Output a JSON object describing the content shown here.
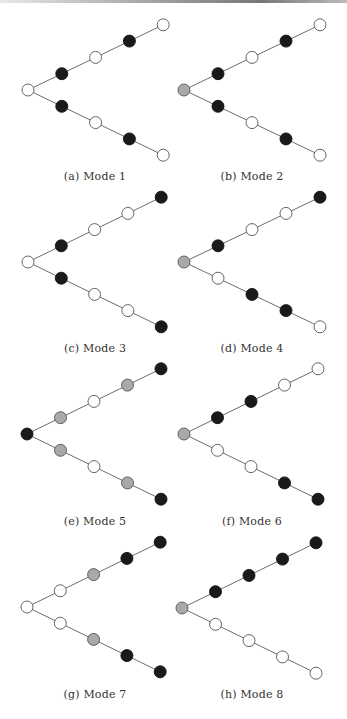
{
  "figure": {
    "colors": {
      "white": "#ffffff",
      "black": "#1a1a1a",
      "gray": "#a9a9a9",
      "edge": "#6e6e6e",
      "stroke": "#555555"
    },
    "node_radius": 6,
    "panels": [
      {
        "id": "a",
        "caption": "(a) Mode 1",
        "root": [
          28,
          90
        ],
        "dx": 33.8,
        "dy": 16.3,
        "caption_pos": [
          95,
          170
        ],
        "root_color": "white",
        "upper": [
          "black",
          "white",
          "black",
          "white"
        ],
        "lower": [
          "black",
          "white",
          "black",
          "white"
        ]
      },
      {
        "id": "b",
        "caption": "(b) Mode 2",
        "root": [
          184,
          90
        ],
        "dx": 34,
        "dy": 16.3,
        "caption_pos": [
          252,
          170
        ],
        "root_color": "gray",
        "upper": [
          "black",
          "white",
          "black",
          "white"
        ],
        "lower": [
          "black",
          "white",
          "black",
          "white"
        ]
      },
      {
        "id": "c",
        "caption": "(c) Mode 3",
        "root": [
          28,
          262
        ],
        "dx": 33.3,
        "dy": 16.2,
        "caption_pos": [
          95,
          342
        ],
        "root_color": "white",
        "upper": [
          "black",
          "white",
          "white",
          "black"
        ],
        "lower": [
          "black",
          "white",
          "white",
          "black"
        ]
      },
      {
        "id": "d",
        "caption": "(d) Mode 4",
        "root": [
          184,
          262
        ],
        "dx": 34,
        "dy": 16.2,
        "caption_pos": [
          252,
          342
        ],
        "root_color": "gray",
        "upper": [
          "black",
          "white",
          "white",
          "black"
        ],
        "lower": [
          "white",
          "black",
          "black",
          "white"
        ]
      },
      {
        "id": "e",
        "caption": "(e) Mode 5",
        "root": [
          27,
          434
        ],
        "dx": 33.5,
        "dy": 16.3,
        "caption_pos": [
          95,
          515
        ],
        "root_color": "black",
        "upper": [
          "gray",
          "white",
          "gray",
          "black"
        ],
        "lower": [
          "gray",
          "white",
          "gray",
          "black"
        ]
      },
      {
        "id": "f",
        "caption": "(f) Mode 6",
        "root": [
          184,
          434
        ],
        "dx": 33.5,
        "dy": 16.3,
        "caption_pos": [
          252,
          515
        ],
        "root_color": "gray",
        "upper": [
          "black",
          "black",
          "white",
          "white"
        ],
        "lower": [
          "white",
          "white",
          "black",
          "black"
        ]
      },
      {
        "id": "g",
        "caption": "(g) Mode 7",
        "root": [
          27,
          607
        ],
        "dx": 33.3,
        "dy": 16.2,
        "caption_pos": [
          95,
          688
        ],
        "root_color": "white",
        "upper": [
          "white",
          "gray",
          "black",
          "black"
        ],
        "lower": [
          "white",
          "gray",
          "black",
          "black"
        ]
      },
      {
        "id": "h",
        "caption": "(h) Mode 8",
        "root": [
          182,
          608
        ],
        "dx": 33.5,
        "dy": 16.3,
        "caption_pos": [
          252,
          688
        ],
        "root_color": "gray",
        "upper": [
          "black",
          "black",
          "black",
          "black"
        ],
        "lower": [
          "white",
          "white",
          "white",
          "white"
        ]
      }
    ]
  }
}
